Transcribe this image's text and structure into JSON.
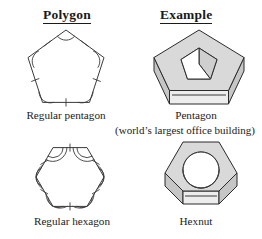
{
  "figure": {
    "columns": [
      {
        "key": "polygon",
        "label": "Polygon"
      },
      {
        "key": "example",
        "label": "Example"
      }
    ],
    "rows": [
      {
        "polygon": {
          "label": "Regular pentagon",
          "shape": "pentagon",
          "sides": 5,
          "congruent_side_ticks": 1,
          "congruent_angle_arcs": 1
        },
        "example": {
          "label": "Pentagon",
          "sublabel": "(world’s largest office building)",
          "shape": "pentagonal-ring-3d",
          "hole": "pentagon"
        }
      },
      {
        "polygon": {
          "label": "Regular hexagon",
          "shape": "hexagon",
          "sides": 6,
          "congruent_side_ticks": 1,
          "congruent_angle_arcs": 2
        },
        "example": {
          "label": "Hexnut",
          "sublabel": "",
          "shape": "hexagonal-prism-3d",
          "hole": "circle"
        }
      }
    ],
    "colors": {
      "line": "#3a3a3a",
      "solid_line": "#2b2b2b",
      "top_face": "#d9d9d9",
      "side_face": "#c6c6c6",
      "band_face": "#ededed",
      "hole_face": "#ffffff",
      "background": "#ffffff"
    }
  }
}
